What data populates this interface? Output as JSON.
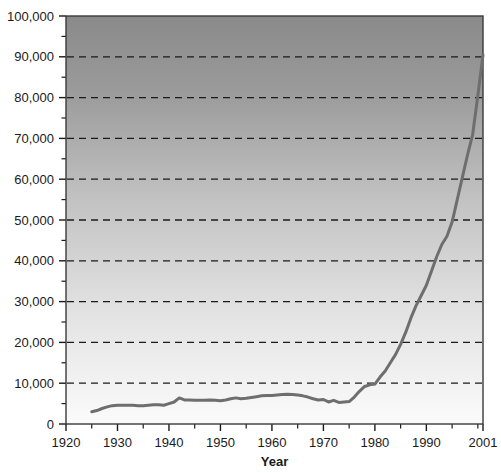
{
  "chart_data": {
    "type": "line",
    "title": "",
    "xlabel": "Year",
    "ylabel": "",
    "xlim": [
      1920,
      2001
    ],
    "ylim": [
      0,
      100000
    ],
    "grid": true,
    "grid_style": "dashed-horizontal",
    "legend": "none",
    "y_ticks": [
      0,
      10000,
      20000,
      30000,
      40000,
      50000,
      60000,
      70000,
      80000,
      90000,
      100000
    ],
    "y_tick_labels": [
      "0",
      "10,000",
      "20,000",
      "30,000",
      "40,000",
      "50,000",
      "60,000",
      "70,000",
      "80,000",
      "90,000",
      "100,000"
    ],
    "y_minor_tick_interval": 5000,
    "x_ticks": [
      1920,
      1930,
      1940,
      1950,
      1960,
      1970,
      1980,
      1990,
      2001
    ],
    "x_tick_labels": [
      "1920",
      "1930",
      "1940",
      "1950",
      "1960",
      "1970",
      "1980",
      "1990",
      "2001"
    ],
    "x_minor_tick_interval": 5,
    "series": [
      {
        "name": "value",
        "color": "#6e6e6e",
        "line_width": 3,
        "x": [
          1925,
          1926,
          1927,
          1928,
          1929,
          1930,
          1931,
          1932,
          1933,
          1934,
          1935,
          1936,
          1937,
          1938,
          1939,
          1940,
          1941,
          1942,
          1943,
          1944,
          1945,
          1946,
          1947,
          1948,
          1949,
          1950,
          1951,
          1952,
          1953,
          1954,
          1955,
          1956,
          1957,
          1958,
          1959,
          1960,
          1961,
          1962,
          1963,
          1964,
          1965,
          1966,
          1967,
          1968,
          1969,
          1970,
          1971,
          1972,
          1973,
          1974,
          1975,
          1976,
          1977,
          1978,
          1979,
          1980,
          1981,
          1982,
          1983,
          1984,
          1985,
          1986,
          1987,
          1988,
          1989,
          1990,
          1991,
          1992,
          1993,
          1994,
          1995,
          1996,
          1997,
          1998,
          1999,
          2000,
          2001
        ],
        "y": [
          3000,
          3300,
          3800,
          4200,
          4500,
          4600,
          4600,
          4600,
          4600,
          4500,
          4500,
          4600,
          4700,
          4700,
          4600,
          5000,
          5400,
          6400,
          5900,
          5900,
          5800,
          5800,
          5800,
          5900,
          5800,
          5700,
          5900,
          6200,
          6400,
          6200,
          6300,
          6500,
          6700,
          6900,
          7000,
          7000,
          7100,
          7200,
          7300,
          7200,
          7100,
          6900,
          6600,
          6200,
          5900,
          6000,
          5400,
          5800,
          5300,
          5400,
          5500,
          6600,
          8000,
          9200,
          9600,
          9800,
          11500,
          13000,
          15000,
          17000,
          19500,
          22500,
          26000,
          29000,
          31500,
          34000,
          37500,
          41000,
          44000,
          46000,
          49500,
          55000,
          60500,
          66000,
          71000,
          80500,
          90500
        ]
      }
    ]
  },
  "plot": {
    "area": {
      "left": 66,
      "top": 16,
      "right": 483,
      "bottom": 424
    },
    "background_gradient_top": "#8a8a8a",
    "background_gradient_bottom": "#fbfbfb",
    "border_color": "#3a3a3a",
    "gridline_color": "#1a1a1a"
  }
}
